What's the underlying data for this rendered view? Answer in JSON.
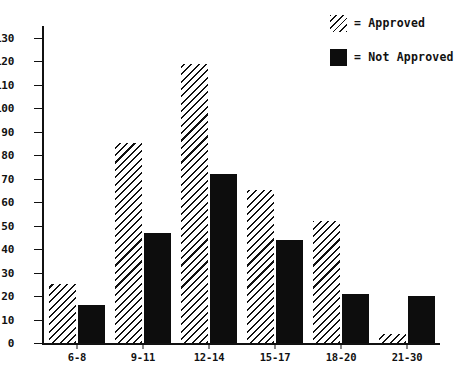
{
  "chart_data": {
    "type": "bar",
    "title": "",
    "xlabel": "",
    "ylabel": "",
    "categories": [
      "6-8",
      "9-11",
      "12-14",
      "15-17",
      "18-20",
      "21-30"
    ],
    "series": [
      {
        "name": "Approved",
        "values": [
          25,
          85,
          119,
          65,
          52,
          4
        ]
      },
      {
        "name": "Not Approved",
        "values": [
          16,
          47,
          72,
          44,
          21,
          20
        ]
      }
    ],
    "ylim": [
      0,
      135
    ],
    "yticks": [
      0,
      10,
      20,
      30,
      40,
      50,
      60,
      70,
      80,
      90,
      100,
      110,
      120,
      130
    ],
    "ytick_labels": [
      "0",
      "10",
      "20",
      "30",
      "40",
      "50",
      "60",
      "70",
      "80",
      "90",
      "100",
      "110",
      "120",
      "130"
    ],
    "grid": false,
    "legend_position": "top-right",
    "legend": [
      {
        "marker": "hatched-swatch",
        "separator": "=",
        "label": "Approved"
      },
      {
        "marker": "solid-black-swatch",
        "separator": "=",
        "label": "Not Approved"
      }
    ],
    "colors": {
      "approved_hatch": "#111111",
      "not_approved_fill": "#0d0d0d",
      "axis": "#111111",
      "background": "#ffffff"
    }
  },
  "legend": {
    "rows": [
      {
        "eq": "= Approved"
      },
      {
        "eq": "= Not Approved"
      }
    ]
  }
}
